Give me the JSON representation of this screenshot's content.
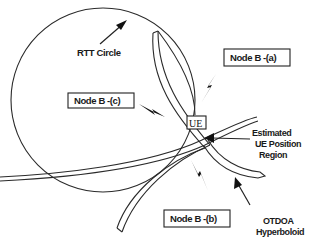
{
  "diagram": {
    "type": "positioning-geometry",
    "labels": {
      "rtt_circle": "RTT Circle",
      "node_b_a": "Node B -(a)",
      "node_b_b": "Node B -(b)",
      "node_b_c": "Node B -(c)",
      "ue": "UE",
      "estimated_line1": "Estimated",
      "estimated_line2": "UE Position",
      "estimated_line3": "Region",
      "otdoa_line1": "OTDOA",
      "otdoa_line2": "Hyperboloid"
    },
    "elements": [
      {
        "id": "rtt-circle",
        "kind": "circle",
        "label": "RTT Circle"
      },
      {
        "id": "hyperboloid-band-1",
        "kind": "curved-band",
        "label": "OTDOA Hyperboloid"
      },
      {
        "id": "hyperboloid-band-2",
        "kind": "curved-band"
      },
      {
        "id": "ue",
        "kind": "box",
        "label": "UE"
      },
      {
        "id": "node-b-a",
        "kind": "labeled-box",
        "label": "Node B -(a)"
      },
      {
        "id": "node-b-b",
        "kind": "labeled-box",
        "label": "Node B -(b)"
      },
      {
        "id": "node-b-c",
        "kind": "labeled-box",
        "label": "Node B -(c)"
      }
    ],
    "signals": [
      "node-b-a",
      "node-b-b",
      "node-b-c"
    ],
    "colors": {
      "line": "#222222",
      "background": "#ffffff"
    }
  }
}
